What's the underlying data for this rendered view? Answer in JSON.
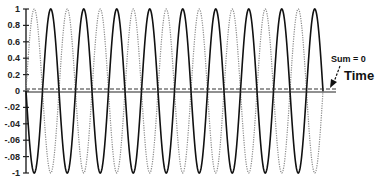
{
  "chart_data": {
    "type": "line",
    "title": "",
    "xlabel": "Time",
    "ylabel": "",
    "ylim": [
      -1,
      1
    ],
    "yticks": [
      "1",
      "0.8",
      "0.6",
      "0.4",
      "0.2",
      "0",
      "-.02",
      "-.04",
      "-.06",
      "-.08",
      "-1"
    ],
    "ytick_values": [
      1,
      0.8,
      0.6,
      0.4,
      0.2,
      0,
      -0.2,
      -0.4,
      -0.6,
      -0.8,
      -1
    ],
    "grid": false,
    "legend": null,
    "series": [
      {
        "name": "wave-solid",
        "style": "solid",
        "amplitude": 1,
        "phase_deg": 180,
        "cycles": 9.0,
        "color": "#111111"
      },
      {
        "name": "wave-dotted",
        "style": "dotted",
        "amplitude": 1,
        "phase_deg": 0,
        "cycles": 9.0,
        "color": "#777777"
      },
      {
        "name": "sum",
        "style": "dashed",
        "amplitude": 0,
        "value": 0,
        "color": "#333333"
      }
    ],
    "annotations": [
      {
        "text": "Sum = 0",
        "points_to": "sum-line"
      },
      {
        "text": "Time",
        "role": "x-axis-label"
      }
    ]
  },
  "labels": {
    "sum": "Sum = 0",
    "time": "Time"
  },
  "layout": {
    "x0": 26,
    "x1": 323,
    "axis_end": 336,
    "y_top": 9,
    "y_zero": 91,
    "y_bottom": 173
  }
}
